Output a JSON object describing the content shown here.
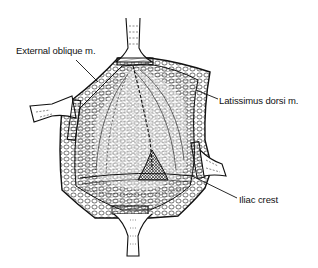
{
  "figure": {
    "type": "anatomical line drawing",
    "colors": {
      "ink": "#111111",
      "background": "#ffffff"
    }
  },
  "labels": {
    "external_oblique": "External oblique m.",
    "latissimus_dorsi": "Latissimus dorsi m.",
    "iliac_crest": "Iliac crest"
  }
}
